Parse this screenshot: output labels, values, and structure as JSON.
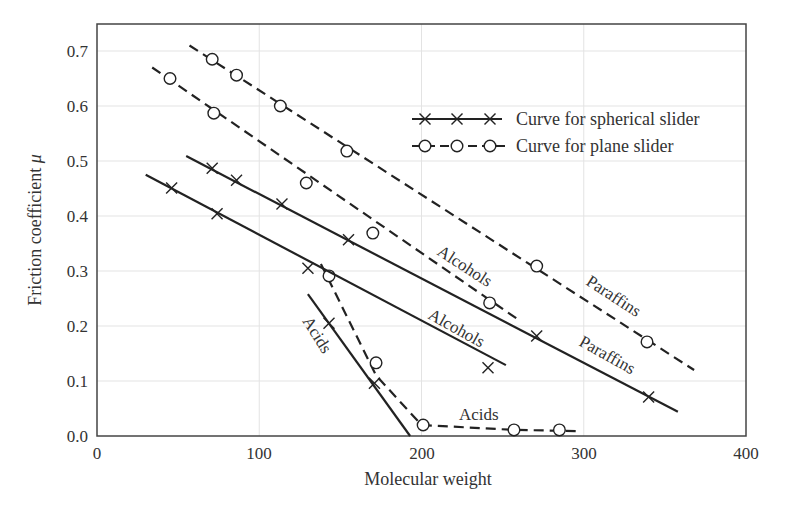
{
  "chart_data": {
    "type": "line",
    "title": "",
    "xlabel": "Molecular weight",
    "ylabel": "Friction coefficient μ",
    "xlim": [
      0,
      400
    ],
    "ylim": [
      0.0,
      0.75
    ],
    "xticks": [
      "0",
      "100",
      "200",
      "300",
      "400"
    ],
    "yticks": [
      "0.0",
      "0.1",
      "0.2",
      "0.3",
      "0.4",
      "0.5",
      "0.6",
      "0.7"
    ],
    "grid": true,
    "legend_position": "upper right",
    "legend": [
      {
        "label": "Curve for spherical slider",
        "style": "solid line, x markers"
      },
      {
        "label": "Curve for plane slider",
        "style": "dashed line, open circle markers"
      }
    ],
    "series": [
      {
        "name": "Paraffins (plane slider)",
        "slider": "plane",
        "family": "Paraffins",
        "line": "dashed",
        "marker": "circle",
        "line_start": [
          57,
          0.71
        ],
        "line_end": [
          368,
          0.12
        ],
        "points": [
          [
            71,
            0.685
          ],
          [
            86,
            0.656
          ],
          [
            113,
            0.6
          ],
          [
            154,
            0.518
          ],
          [
            271,
            0.309
          ],
          [
            339,
            0.171
          ]
        ]
      },
      {
        "name": "Alcohols (plane slider)",
        "slider": "plane",
        "family": "Alcohols",
        "line": "dashed",
        "marker": "circle",
        "line_start": [
          34,
          0.67
        ],
        "line_end": [
          259,
          0.213
        ],
        "points": [
          [
            45,
            0.65
          ],
          [
            72,
            0.587
          ],
          [
            129,
            0.46
          ],
          [
            170,
            0.369
          ],
          [
            242,
            0.242
          ]
        ]
      },
      {
        "name": "Acids (plane slider)",
        "slider": "plane",
        "family": "Acids",
        "line": "dashed",
        "marker": "circle",
        "line_start": [
          138,
          0.313
        ],
        "line_end": [
          297,
          0.009
        ],
        "points": [
          [
            143,
            0.291
          ],
          [
            172,
            0.133
          ],
          [
            201,
            0.02
          ],
          [
            257,
            0.011
          ],
          [
            285,
            0.011
          ]
        ]
      },
      {
        "name": "Paraffins (spherical slider)",
        "slider": "spherical",
        "family": "Paraffins",
        "line": "solid",
        "marker": "x",
        "line_start": [
          55,
          0.509
        ],
        "line_end": [
          358,
          0.044
        ],
        "points": [
          [
            71,
            0.487
          ],
          [
            86,
            0.465
          ],
          [
            114,
            0.422
          ],
          [
            155,
            0.357
          ],
          [
            271,
            0.182
          ],
          [
            340,
            0.071
          ]
        ]
      },
      {
        "name": "Alcohols (spherical slider)",
        "slider": "spherical",
        "family": "Alcohols",
        "line": "solid",
        "marker": "x",
        "line_start": [
          30,
          0.475
        ],
        "line_end": [
          252,
          0.129
        ],
        "points": [
          [
            46,
            0.451
          ],
          [
            74,
            0.404
          ],
          [
            130,
            0.305
          ],
          [
            241,
            0.124
          ]
        ]
      },
      {
        "name": "Acids (spherical slider)",
        "slider": "spherical",
        "family": "Acids",
        "line": "solid",
        "marker": "x",
        "line_start": [
          130,
          0.258
        ],
        "line_end": [
          193,
          0.0
        ],
        "points": [
          [
            143,
            0.205
          ],
          [
            171,
            0.096
          ]
        ]
      }
    ],
    "annotations": [
      {
        "text": "Paraffins",
        "near": "plane slider paraffins curve"
      },
      {
        "text": "Alcohols",
        "near": "plane slider alcohols curve"
      },
      {
        "text": "Paraffins",
        "near": "spherical slider paraffins curve"
      },
      {
        "text": "Alcohols",
        "near": "spherical slider alcohols curve"
      },
      {
        "text": "Acids",
        "near": "spherical slider acids curve"
      },
      {
        "text": "Acids",
        "near": "plane slider acids curve"
      }
    ]
  },
  "labels": {
    "xlabel": "Molecular weight",
    "ylabel_text": "Friction coefficient ",
    "ylabel_symbol": "μ",
    "legend_spherical": "Curve for spherical slider",
    "legend_plane": "Curve for plane slider",
    "paraffins_plane": "Paraffins",
    "alcohols_plane": "Alcohols",
    "paraffins_spherical": "Paraffins",
    "alcohols_spherical": "Alcohols",
    "acids_spherical": "Acids",
    "acids_plane": "Acids",
    "xticks": [
      "0",
      "100",
      "200",
      "300",
      "400"
    ],
    "yticks": [
      "0.0",
      "0.1",
      "0.2",
      "0.3",
      "0.4",
      "0.5",
      "0.6",
      "0.7"
    ]
  },
  "colors": {
    "line": "#222222",
    "axis": "#444444",
    "grid": "#e3e3e3",
    "text": "#333333"
  }
}
